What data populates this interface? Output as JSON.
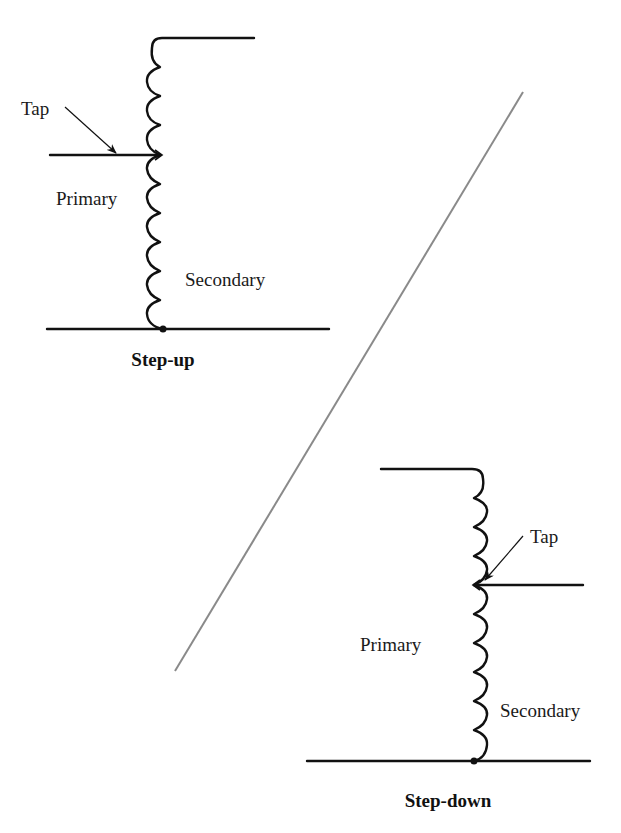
{
  "figure": {
    "colors": {
      "ink": "#111111",
      "divider": "#8a8a8a",
      "background": "#ffffff"
    },
    "step_up": {
      "title": "Step-up",
      "tap_label": "Tap",
      "primary_label": "Primary",
      "secondary_label": "Secondary",
      "upper_coil_loops": 4,
      "lower_coil_loops": 6,
      "loop_direction": "left"
    },
    "step_down": {
      "title": "Step-down",
      "tap_label": "Tap",
      "primary_label": "Primary",
      "secondary_label": "Secondary",
      "upper_coil_loops": 4,
      "lower_coil_loops": 6,
      "loop_direction": "right"
    },
    "divider": {
      "x1": 175,
      "y1": 671,
      "x2": 523,
      "y2": 92
    }
  }
}
